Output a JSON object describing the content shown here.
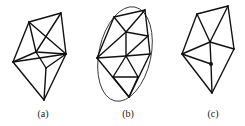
{
  "figure": {
    "panels": [
      {
        "id": "a",
        "label": "(a)",
        "label_pos": [
          43,
          117
        ],
        "vertices": {
          "TL": [
            29,
            22
          ],
          "TR": [
            61,
            13
          ],
          "Right": [
            66,
            54
          ],
          "Inner": [
            36,
            52
          ],
          "Left": [
            13,
            62
          ],
          "LowerMid": [
            46,
            68
          ],
          "Bottom": [
            44,
            100
          ]
        },
        "edges": [
          [
            "TL",
            "TR"
          ],
          [
            "TL",
            "Left"
          ],
          [
            "TL",
            "Right"
          ],
          [
            "TL",
            "Inner"
          ],
          [
            "TR",
            "Inner"
          ],
          [
            "TR",
            "Right"
          ],
          [
            "Left",
            "Inner"
          ],
          [
            "Left",
            "Right"
          ],
          [
            "Inner",
            "Right"
          ],
          [
            "Inner",
            "LowerMid"
          ],
          [
            "Right",
            "LowerMid"
          ],
          [
            "Left",
            "Bottom"
          ],
          [
            "LowerMid",
            "Bottom"
          ],
          [
            "Right",
            "Bottom"
          ]
        ],
        "dots": [],
        "ellipse": null
      },
      {
        "id": "b",
        "label": "(b)",
        "label_pos": [
          128,
          117
        ],
        "vertices": {
          "TL": [
            114,
            17
          ],
          "TR": [
            145,
            10
          ],
          "Mid": [
            126,
            32
          ],
          "RightMid": [
            148,
            36
          ],
          "RightLower": [
            150,
            54
          ],
          "Center": [
            126,
            56
          ],
          "Left": [
            97,
            58
          ],
          "LL": [
            113,
            77
          ],
          "LR": [
            138,
            77
          ],
          "Bottom": [
            129,
            97
          ]
        },
        "edges": [
          [
            "TL",
            "TR"
          ],
          [
            "TL",
            "Mid"
          ],
          [
            "TL",
            "Left"
          ],
          [
            "TR",
            "Mid"
          ],
          [
            "TR",
            "RightMid"
          ],
          [
            "Mid",
            "RightMid"
          ],
          [
            "Mid",
            "Left"
          ],
          [
            "Mid",
            "Center"
          ],
          [
            "RightMid",
            "Center"
          ],
          [
            "RightMid",
            "RightLower"
          ],
          [
            "Left",
            "Center"
          ],
          [
            "Center",
            "RightLower"
          ],
          [
            "Left",
            "Bottom"
          ],
          [
            "Center",
            "LL"
          ],
          [
            "Center",
            "LR"
          ],
          [
            "LL",
            "LR"
          ],
          [
            "LL",
            "Bottom"
          ],
          [
            "LR",
            "Bottom"
          ],
          [
            "RightLower",
            "Bottom"
          ]
        ],
        "dots": [],
        "ellipse": {
          "cx": 125,
          "cy": 54,
          "rx": 26,
          "ry": 48,
          "rotate": 12
        }
      },
      {
        "id": "c",
        "label": "(c)",
        "label_pos": [
          213,
          117
        ],
        "vertices": {
          "TL": [
            197,
            14
          ],
          "TR": [
            228,
            6
          ],
          "Center": [
            210,
            42
          ],
          "Right": [
            234,
            49
          ],
          "Left": [
            182,
            54
          ],
          "Dot": [
            211,
            64
          ],
          "Bottom": [
            212,
            93
          ]
        },
        "edges": [
          [
            "TL",
            "TR"
          ],
          [
            "TL",
            "Left"
          ],
          [
            "TL",
            "Center"
          ],
          [
            "TR",
            "Center"
          ],
          [
            "TR",
            "Right"
          ],
          [
            "Center",
            "Right"
          ],
          [
            "Center",
            "Left"
          ],
          [
            "Center",
            "Dot"
          ],
          [
            "Left",
            "Dot"
          ],
          [
            "Dot",
            "Bottom"
          ],
          [
            "Left",
            "Bottom"
          ],
          [
            "Right",
            "Bottom"
          ]
        ],
        "dots": [
          "Dot"
        ],
        "ellipse": null
      }
    ]
  }
}
